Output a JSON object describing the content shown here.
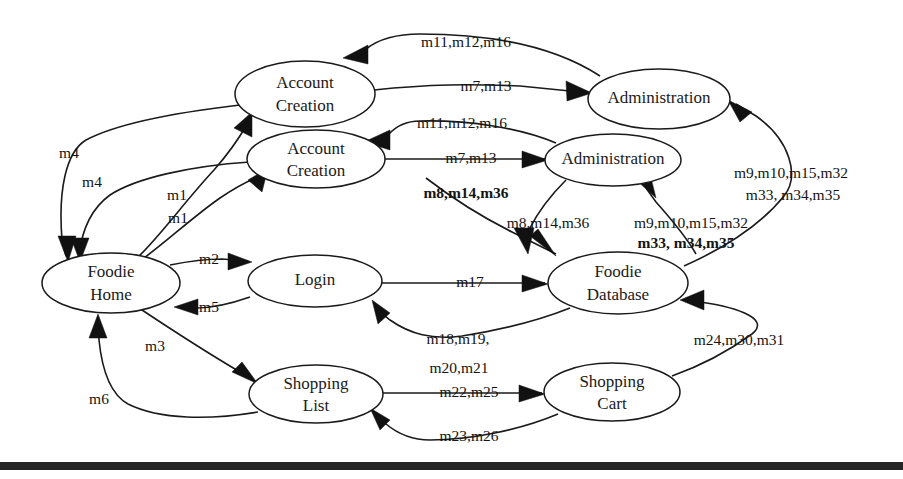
{
  "diagram": {
    "background_color": "#ffffff",
    "stroke_color": "#1a1a1a",
    "nodes": [
      {
        "id": "account_creation_1",
        "label_line1": "Account",
        "label_line2": "Creation",
        "cx": 305,
        "cy": 94,
        "rx": 70,
        "ry": 33
      },
      {
        "id": "account_creation_2",
        "label_line1": "Account",
        "label_line2": "Creation",
        "cx": 316,
        "cy": 159,
        "rx": 69,
        "ry": 29
      },
      {
        "id": "administration_1",
        "label_line1": "Administration",
        "label_line2": "",
        "cx": 659,
        "cy": 99,
        "rx": 71,
        "ry": 30
      },
      {
        "id": "administration_2",
        "label_line1": "Administration",
        "label_line2": "",
        "cx": 613,
        "cy": 160,
        "rx": 68,
        "ry": 26
      },
      {
        "id": "foodie_home",
        "label_line1": "Foodie",
        "label_line2": "Home",
        "cx": 111,
        "cy": 283,
        "rx": 69,
        "ry": 30
      },
      {
        "id": "login",
        "label_line1": "Login",
        "label_line2": "",
        "cx": 315,
        "cy": 281,
        "rx": 67,
        "ry": 26
      },
      {
        "id": "foodie_database",
        "label_line1": "Foodie",
        "label_line2": "Database",
        "cx": 618,
        "cy": 283,
        "rx": 70,
        "ry": 31
      },
      {
        "id": "shopping_list",
        "label_line1": "Shopping",
        "label_line2": "List",
        "cx": 316,
        "cy": 394,
        "rx": 67,
        "ry": 29
      },
      {
        "id": "shopping_cart",
        "label_line1": "Shopping",
        "label_line2": "Cart",
        "cx": 612,
        "cy": 392,
        "rx": 68,
        "ry": 29
      }
    ],
    "edge_labels": [
      {
        "id": "lbl_m11_top",
        "text": "m11,m12,m16",
        "x": 466,
        "y": 43
      },
      {
        "id": "lbl_m7_top",
        "text": "m7,m13",
        "x": 486,
        "y": 87
      },
      {
        "id": "lbl_m11_mid",
        "text": "m11,m12,m16",
        "x": 462,
        "y": 124
      },
      {
        "id": "lbl_m7_mid",
        "text": "m7,m13",
        "x": 471,
        "y": 159
      },
      {
        "id": "lbl_m4_upper",
        "text": "m4",
        "x": 69,
        "y": 154
      },
      {
        "id": "lbl_m4_lower",
        "text": "m4",
        "x": 92,
        "y": 183
      },
      {
        "id": "lbl_m1_upper",
        "text": "m1",
        "x": 177,
        "y": 196
      },
      {
        "id": "lbl_m1_lower",
        "text": "m1",
        "x": 178,
        "y": 219
      },
      {
        "id": "lbl_m8_upper",
        "text": "m8,m14,m36",
        "x": 466,
        "y": 194
      },
      {
        "id": "lbl_m8_lower",
        "text": "m8,m14,m36",
        "x": 548,
        "y": 224
      },
      {
        "id": "lbl_m9_right_1",
        "text": "m9,m10,m15,m32",
        "x": 791,
        "y": 174
      },
      {
        "id": "lbl_m9_right_2",
        "text": "m33, m34,m35",
        "x": 793,
        "y": 196
      },
      {
        "id": "lbl_m9_db_1",
        "text": "m9,m10,m15,m32",
        "x": 691,
        "y": 224
      },
      {
        "id": "lbl_m9_db_2",
        "text": "m33, m34,m35",
        "x": 686,
        "y": 244
      },
      {
        "id": "lbl_m2",
        "text": "m2",
        "x": 209,
        "y": 260
      },
      {
        "id": "lbl_m5",
        "text": "m5",
        "x": 209,
        "y": 308
      },
      {
        "id": "lbl_m17",
        "text": "m17",
        "x": 470,
        "y": 283
      },
      {
        "id": "lbl_m3",
        "text": "m3",
        "x": 155,
        "y": 347
      },
      {
        "id": "lbl_m6",
        "text": "m6",
        "x": 99,
        "y": 400
      },
      {
        "id": "lbl_m18",
        "text": "m18,m19,",
        "x": 458,
        "y": 340
      },
      {
        "id": "lbl_m20",
        "text": "m20,m21",
        "x": 459,
        "y": 369
      },
      {
        "id": "lbl_m22",
        "text": "m22,m25",
        "x": 469,
        "y": 393
      },
      {
        "id": "lbl_m23",
        "text": "m23,m26",
        "x": 469,
        "y": 437
      },
      {
        "id": "lbl_m24",
        "text": "m24,m30,m31",
        "x": 739,
        "y": 341
      }
    ],
    "edges": [
      {
        "id": "e_ac1_to_admin1",
        "from": "account_creation_1",
        "to": "administration_1",
        "label": "m7,m13"
      },
      {
        "id": "e_admin1_to_ac1",
        "from": "administration_1",
        "to": "account_creation_1",
        "label": "m11,m12,m16"
      },
      {
        "id": "e_ac2_to_admin2",
        "from": "account_creation_2",
        "to": "administration_2",
        "label": "m7,m13"
      },
      {
        "id": "e_admin2_to_ac2",
        "from": "administration_2",
        "to": "account_creation_2",
        "label": "m11,m12,m16"
      },
      {
        "id": "e_ac1_to_home",
        "from": "account_creation_1",
        "to": "foodie_home",
        "label": "m4"
      },
      {
        "id": "e_ac2_to_home",
        "from": "account_creation_2",
        "to": "foodie_home",
        "label": "m4"
      },
      {
        "id": "e_home_to_ac1",
        "from": "foodie_home",
        "to": "account_creation_1",
        "label": "m1"
      },
      {
        "id": "e_home_to_ac2",
        "from": "foodie_home",
        "to": "account_creation_2",
        "label": "m1"
      },
      {
        "id": "e_ac_to_db_1",
        "from": "account_creation_1",
        "to": "foodie_database",
        "label": "m8,m14,m36"
      },
      {
        "id": "e_ac_to_db_2",
        "from": "account_creation_2",
        "to": "foodie_database",
        "label": "m8,m14,m36"
      },
      {
        "id": "e_db_to_admin1",
        "from": "foodie_database",
        "to": "administration_1",
        "label": "m9,m10,m15,m32 m33, m34,m35"
      },
      {
        "id": "e_db_to_admin2",
        "from": "foodie_database",
        "to": "administration_2",
        "label": "m9,m10,m15,m32 m33, m34,m35"
      },
      {
        "id": "e_home_to_login",
        "from": "foodie_home",
        "to": "login",
        "label": "m2"
      },
      {
        "id": "e_login_to_home",
        "from": "login",
        "to": "foodie_home",
        "label": "m5"
      },
      {
        "id": "e_login_to_db",
        "from": "login",
        "to": "foodie_database",
        "label": "m17"
      },
      {
        "id": "e_db_to_login",
        "from": "foodie_database",
        "to": "login",
        "label": "m18,m19, m20,m21"
      },
      {
        "id": "e_home_to_list",
        "from": "foodie_home",
        "to": "shopping_list",
        "label": "m3"
      },
      {
        "id": "e_list_to_home",
        "from": "shopping_list",
        "to": "foodie_home",
        "label": "m6"
      },
      {
        "id": "e_list_to_cart",
        "from": "shopping_list",
        "to": "shopping_cart",
        "label": "m22,m25"
      },
      {
        "id": "e_cart_to_list",
        "from": "shopping_cart",
        "to": "shopping_list",
        "label": "m23,m26"
      },
      {
        "id": "e_cart_to_db",
        "from": "shopping_cart",
        "to": "foodie_database",
        "label": "m24,m30,m31"
      }
    ],
    "footer_bar": {
      "color": "#262626",
      "y": 462,
      "height": 8
    }
  }
}
